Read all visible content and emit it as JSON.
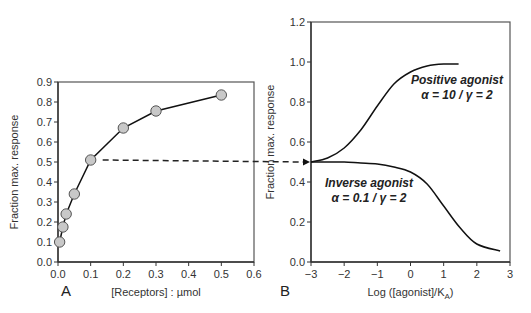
{
  "chart_data": [
    {
      "panel": "A",
      "type": "line",
      "markers": true,
      "xlabel": "[Receptors] : µmol",
      "ylabel": "Fraction max. response",
      "xlim": [
        0.0,
        0.6
      ],
      "ylim": [
        0.0,
        0.9
      ],
      "xticks": [
        "0.0",
        "0.1",
        "0.2",
        "0.3",
        "0.4",
        "0.5",
        "0.6"
      ],
      "yticks": [
        "0.0",
        "0.1",
        "0.2",
        "0.3",
        "0.4",
        "0.5",
        "0.6",
        "0.7",
        "0.8",
        "0.9"
      ],
      "grid": false,
      "series": [
        {
          "name": "Response vs receptor concentration",
          "x": [
            0.005,
            0.015,
            0.025,
            0.05,
            0.1,
            0.2,
            0.3,
            0.5
          ],
          "y": [
            0.1,
            0.175,
            0.24,
            0.34,
            0.51,
            0.67,
            0.755,
            0.835
          ]
        }
      ]
    },
    {
      "panel": "B",
      "type": "line",
      "markers": false,
      "xlabel": "Log ([agonist]/K",
      "xlabel_sub": "A",
      "xlabel_end": ")",
      "ylabel": "Fraction max. response",
      "xlim": [
        -3,
        3
      ],
      "ylim": [
        0.0,
        1.2
      ],
      "xticks": [
        "−3",
        "−2",
        "−1",
        "0",
        "1",
        "2",
        "3"
      ],
      "yticks": [
        "0.0",
        "0.2",
        "0.4",
        "0.6",
        "0.8",
        "1.0",
        "1.2"
      ],
      "grid": false,
      "series": [
        {
          "name": "Positive agonist",
          "params": "α = 10 / γ = 2",
          "x": [
            -3,
            -2.5,
            -2,
            -1.5,
            -1,
            -0.5,
            0,
            0.5,
            1,
            1.45
          ],
          "y": [
            0.5,
            0.52,
            0.57,
            0.66,
            0.78,
            0.89,
            0.95,
            0.98,
            0.99,
            0.99
          ]
        },
        {
          "name": "Inverse agonist",
          "params": "α = 0.1 / γ = 2",
          "x": [
            -3,
            -2.5,
            -2,
            -1.5,
            -1,
            -0.5,
            0,
            0.5,
            1,
            1.5,
            2,
            2.7
          ],
          "y": [
            0.5,
            0.5,
            0.5,
            0.495,
            0.49,
            0.475,
            0.45,
            0.39,
            0.28,
            0.17,
            0.09,
            0.055
          ]
        }
      ]
    }
  ],
  "annotations": {
    "connector": "Dashed arrow from panel A point (0.1, 0.51) to panel B y-axis at 0.5",
    "positive_label": "Positive agonist",
    "positive_params": "α = 10 / γ = 2",
    "inverse_label": "Inverse agonist",
    "inverse_params": "α = 0.1 / γ = 2"
  },
  "panel_labels": {
    "a": "A",
    "b": "B"
  }
}
